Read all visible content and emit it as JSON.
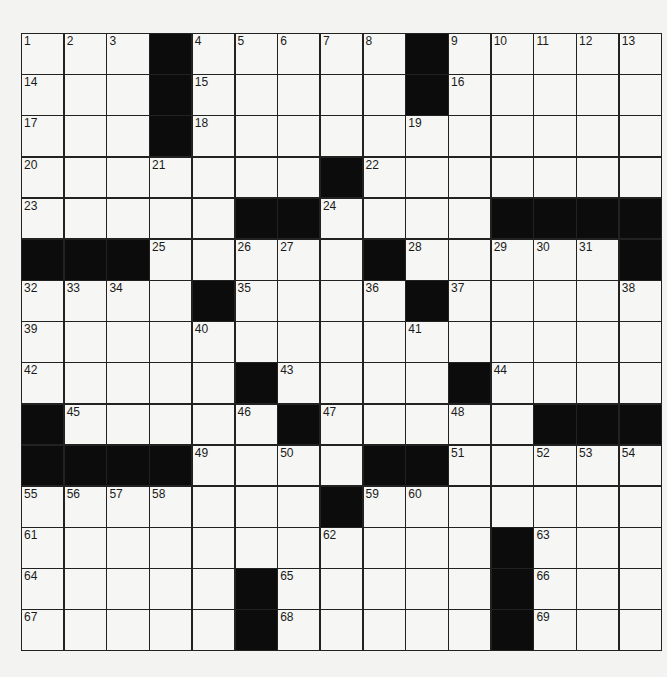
{
  "puzzle": {
    "rows": 15,
    "cols": 15,
    "colors": {
      "background": "#f3f3f1",
      "cell": "#f6f6f4",
      "block": "#0c0c0c",
      "line": "#222222"
    },
    "layout": [
      "...#.....#.....",
      "...#.....#.....",
      "...#...........",
      ".......#.......",
      ".....##....####",
      "###.....#.....#",
      "....#....#.....",
      "...............",
      ".....#....#....",
      "#.....#.....###",
      "####....##.....",
      ".......#.......",
      "...........#...",
      ".....#.....#...",
      ".....#.....#..."
    ],
    "numbers": [
      [
        1,
        2,
        3,
        0,
        4,
        5,
        6,
        7,
        8,
        0,
        9,
        10,
        11,
        12,
        13
      ],
      [
        14,
        0,
        0,
        0,
        15,
        0,
        0,
        0,
        0,
        0,
        16,
        0,
        0,
        0,
        0
      ],
      [
        17,
        0,
        0,
        0,
        18,
        0,
        0,
        0,
        0,
        19,
        0,
        0,
        0,
        0,
        0
      ],
      [
        20,
        0,
        0,
        21,
        0,
        0,
        0,
        0,
        22,
        0,
        0,
        0,
        0,
        0,
        0
      ],
      [
        23,
        0,
        0,
        0,
        0,
        0,
        0,
        24,
        0,
        0,
        0,
        0,
        0,
        0,
        0
      ],
      [
        0,
        0,
        0,
        25,
        0,
        26,
        27,
        0,
        0,
        28,
        0,
        29,
        30,
        31,
        0
      ],
      [
        32,
        33,
        34,
        0,
        0,
        35,
        0,
        0,
        36,
        0,
        37,
        0,
        0,
        0,
        38
      ],
      [
        39,
        0,
        0,
        0,
        40,
        0,
        0,
        0,
        0,
        41,
        0,
        0,
        0,
        0,
        0
      ],
      [
        42,
        0,
        0,
        0,
        0,
        0,
        43,
        0,
        0,
        0,
        0,
        44,
        0,
        0,
        0
      ],
      [
        0,
        45,
        0,
        0,
        0,
        46,
        0,
        47,
        0,
        0,
        48,
        0,
        0,
        0,
        0
      ],
      [
        0,
        0,
        0,
        0,
        49,
        0,
        50,
        0,
        0,
        0,
        51,
        0,
        52,
        53,
        54
      ],
      [
        55,
        56,
        57,
        58,
        0,
        0,
        0,
        0,
        59,
        60,
        0,
        0,
        0,
        0,
        0
      ],
      [
        61,
        0,
        0,
        0,
        0,
        0,
        0,
        62,
        0,
        0,
        0,
        0,
        63,
        0,
        0
      ],
      [
        64,
        0,
        0,
        0,
        0,
        0,
        65,
        0,
        0,
        0,
        0,
        0,
        66,
        0,
        0
      ],
      [
        67,
        0,
        0,
        0,
        0,
        0,
        68,
        0,
        0,
        0,
        0,
        0,
        69,
        0,
        0
      ]
    ],
    "letters": []
  }
}
